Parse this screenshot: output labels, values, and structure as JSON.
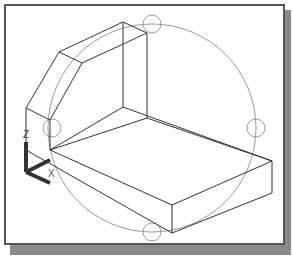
{
  "viewport": {
    "view": "isometric wireframe",
    "background": "#ffffff",
    "frame_color": "#555555",
    "shadow_color": "#8a8a8a"
  },
  "ucs_icon": {
    "z_label": "Z",
    "x_label": "X",
    "color": "#333333"
  },
  "model": {
    "edge_color": "#333333",
    "description": "L-shaped bracket with chamfered top, wireframe"
  },
  "orbit_arcball": {
    "color": "#999999",
    "center": [
      152,
      128
    ],
    "radius": 104,
    "grips": [
      "top",
      "left",
      "right",
      "bottom"
    ]
  }
}
